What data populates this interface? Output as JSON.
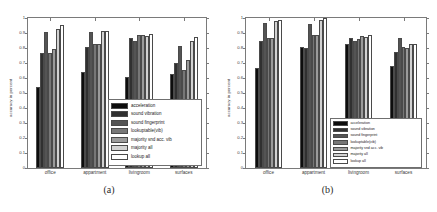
{
  "figure": {
    "panels": [
      {
        "caption": "(a)",
        "ylabel": "accuracy in percent",
        "xlabel": ""
      },
      {
        "caption": "(b)",
        "ylabel": "accuracy in percent",
        "xlabel": ""
      }
    ]
  },
  "yticks": [
    "0",
    "0.1",
    "0.2",
    "0.3",
    "0.4",
    "0.5",
    "0.6",
    "0.7",
    "0.8",
    "0.9",
    "1"
  ],
  "series_colors": [
    "#0d0d0d",
    "#303030",
    "#545454",
    "#777777",
    "#9b9b9b",
    "#d2d2d2",
    "#ffffff"
  ],
  "chart_data": [
    {
      "type": "bar",
      "title": "",
      "panel": "(a)",
      "xlabel": "",
      "ylabel": "accuracy in percent",
      "ylim": [
        0,
        1
      ],
      "yticks": [
        0,
        0.1,
        0.2,
        0.3,
        0.4,
        0.5,
        0.6,
        0.7,
        0.8,
        0.9,
        1
      ],
      "grid": false,
      "legend_position": "inside lower right",
      "categories": [
        "office",
        "appartment",
        "livingroom",
        "surfaces"
      ],
      "series": [
        {
          "name": "acceleration",
          "values": [
            0.54,
            0.64,
            0.605,
            0.625
          ]
        },
        {
          "name": "sound vibration",
          "values": [
            0.77,
            0.805,
            0.87,
            0.7
          ]
        },
        {
          "name": "sound fingerprint",
          "values": [
            0.91,
            0.905,
            0.85,
            0.815
          ]
        },
        {
          "name": "lookuptable(vib)",
          "values": [
            0.77,
            0.825,
            0.89,
            0.655
          ]
        },
        {
          "name": "majority snd acc. vib",
          "values": [
            0.795,
            0.83,
            0.885,
            0.72
          ]
        },
        {
          "name": "majority all",
          "values": [
            0.925,
            0.915,
            0.88,
            0.845
          ]
        },
        {
          "name": "lookup all",
          "values": [
            0.955,
            0.915,
            0.895,
            0.875
          ]
        }
      ]
    },
    {
      "type": "bar",
      "title": "",
      "panel": "(b)",
      "xlabel": "",
      "ylabel": "accuracy in percent",
      "ylim": [
        0,
        1
      ],
      "yticks": [
        0,
        0.1,
        0.2,
        0.3,
        0.4,
        0.5,
        0.6,
        0.7,
        0.8,
        0.9,
        1
      ],
      "grid": false,
      "legend_position": "inside lower right",
      "categories": [
        "office",
        "appartment",
        "livingroom",
        "surfaces"
      ],
      "series": [
        {
          "name": "acceleration",
          "values": [
            0.665,
            0.81,
            0.83,
            0.68
          ]
        },
        {
          "name": "sound vibration",
          "values": [
            0.85,
            0.8,
            0.865,
            0.775
          ]
        },
        {
          "name": "sound fingerprint",
          "values": [
            0.965,
            0.96,
            0.845,
            0.865
          ]
        },
        {
          "name": "lookuptable(vib)",
          "values": [
            0.87,
            0.89,
            0.86,
            0.81
          ]
        },
        {
          "name": "majority snd acc. vib",
          "values": [
            0.865,
            0.885,
            0.88,
            0.8
          ]
        },
        {
          "name": "majority all",
          "values": [
            0.98,
            0.985,
            0.875,
            0.825
          ]
        },
        {
          "name": "lookup all",
          "values": [
            0.985,
            1.0,
            0.885,
            0.83
          ]
        }
      ]
    }
  ]
}
